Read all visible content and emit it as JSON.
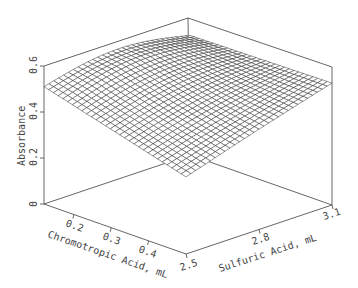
{
  "chart_data": {
    "type": "surface3d",
    "title": "",
    "xlabel": "Chromotropic Acid, mL",
    "ylabel": "Sulfuric Acid, mL",
    "zlabel": "Absorbance",
    "x_ticks": [
      "0.2",
      "0.3",
      "0.4"
    ],
    "y_ticks": [
      "2.5",
      "2.8",
      "3.1"
    ],
    "z_ticks": [
      "0",
      "0.2",
      "0.4",
      "0.6"
    ],
    "xlim": [
      0.12,
      0.5
    ],
    "ylim": [
      2.5,
      3.1
    ],
    "zlim": [
      0,
      0.6
    ],
    "grid": false,
    "mesh_resolution": [
      30,
      30
    ],
    "corner_values": {
      "chromo_min_sulfuric_min": 0.51,
      "chromo_max_sulfuric_min": 0.365,
      "chromo_max_sulfuric_max": 0.53,
      "chromo_min_sulfuric_max": 0.52
    },
    "peak_value": 0.575,
    "style": "wireframe mesh, black lines on white"
  }
}
